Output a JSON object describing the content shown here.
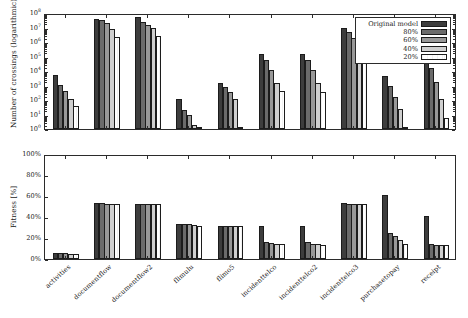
{
  "figure": {
    "title": "",
    "legend_title": ""
  },
  "legend": {
    "position": "top-right",
    "entries": [
      {
        "label": "Original model",
        "shade": "#3d3d3d"
      },
      {
        "label": "80%",
        "shade": "#6b6b6b"
      },
      {
        "label": "60%",
        "shade": "#989898"
      },
      {
        "label": "40%",
        "shade": "#cfcfcf"
      },
      {
        "label": "20%",
        "shade": "#ffffff"
      }
    ]
  },
  "chart_data": [
    {
      "type": "bar",
      "id": "crossings",
      "title": "",
      "xlabel": "",
      "ylabel": "Number of crossings (logarithmic)",
      "yscale": "log",
      "ylim": [
        1,
        100000000
      ],
      "ytick_labels": [
        "10⁰",
        "10¹",
        "10²",
        "10³",
        "10⁴",
        "10⁵",
        "10⁶",
        "10⁷",
        "10⁸"
      ],
      "ytick_mantissas": [
        "0",
        "1",
        "2",
        "3",
        "4",
        "5",
        "6",
        "7",
        "8"
      ],
      "grid": false,
      "legend_position": "upper right",
      "categories": [
        "activities",
        "documentflow",
        "documentflow2",
        "flimulu",
        "flimo5",
        "incidenttelco",
        "incidenttelco2",
        "incidenttelco3",
        "purchasetopay",
        "receipt"
      ],
      "series": [
        {
          "name": "Original model",
          "values": [
            5000,
            40000000,
            55000000,
            110,
            1500,
            150000,
            160000,
            9000000,
            4500,
            90000
          ]
        },
        {
          "name": "80%",
          "values": [
            1100,
            35000000,
            25000000,
            20,
            800,
            60000,
            60000,
            5000000,
            900,
            15000
          ]
        },
        {
          "name": "60%",
          "values": [
            400,
            20000000,
            15000000,
            10,
            380,
            12000,
            12000,
            2000000,
            170,
            1700
          ]
        },
        {
          "name": "40%",
          "values": [
            120,
            8000000,
            10000000,
            2,
            110,
            1400,
            1400,
            700000,
            25,
            120
          ]
        },
        {
          "name": "20%",
          "values": [
            38,
            2300000,
            2600000,
            1,
            1,
            400,
            380,
            60000,
            1,
            6
          ]
        }
      ]
    },
    {
      "type": "bar",
      "id": "fitness",
      "title": "",
      "xlabel": "",
      "ylabel": "Fitness [%]",
      "yscale": "linear",
      "ylim": [
        0,
        100
      ],
      "ytick_labels": [
        "0%",
        "20%",
        "40%",
        "60%",
        "80%",
        "100%"
      ],
      "ytick_values": [
        0,
        20,
        40,
        60,
        80,
        100
      ],
      "grid": false,
      "categories": [
        "activities",
        "documentflow",
        "documentflow2",
        "flimulu",
        "flimo5",
        "incidenttelco",
        "incidenttelco2",
        "incidenttelco3",
        "purchasetopay",
        "receipt"
      ],
      "series": [
        {
          "name": "Original model",
          "values": [
            6,
            53,
            52,
            33,
            31,
            31,
            31,
            53,
            61,
            41
          ]
        },
        {
          "name": "80%",
          "values": [
            6,
            53,
            52,
            33,
            31,
            16,
            16,
            52,
            25,
            14
          ]
        },
        {
          "name": "60%",
          "values": [
            6,
            52,
            52,
            33,
            31,
            15,
            14,
            52,
            22,
            13
          ]
        },
        {
          "name": "40%",
          "values": [
            5,
            52,
            52,
            32,
            31,
            14,
            14,
            52,
            18,
            13
          ]
        },
        {
          "name": "20%",
          "values": [
            5,
            52,
            52,
            31,
            31,
            14,
            13,
            52,
            14,
            13
          ]
        }
      ]
    }
  ]
}
